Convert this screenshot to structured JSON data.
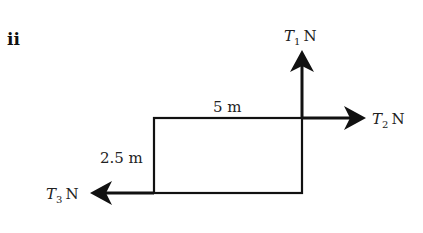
{
  "part_label": "ii",
  "diagram": {
    "type": "free-body force diagram on rectangular lamina",
    "rectangle": {
      "width_label": "5 m",
      "height_label": "2.5 m"
    },
    "forces": [
      {
        "id": "T1",
        "symbol": "T",
        "subscript": "1",
        "unit": "N",
        "direction": "up",
        "point": "top-right corner"
      },
      {
        "id": "T2",
        "symbol": "T",
        "subscript": "2",
        "unit": "N",
        "direction": "right",
        "point": "top-right corner"
      },
      {
        "id": "T3",
        "symbol": "T",
        "subscript": "3",
        "unit": "N",
        "direction": "left",
        "point": "bottom-left corner"
      }
    ],
    "colors": {
      "line": "#111111",
      "text": "#222222",
      "background": "#ffffff"
    }
  }
}
